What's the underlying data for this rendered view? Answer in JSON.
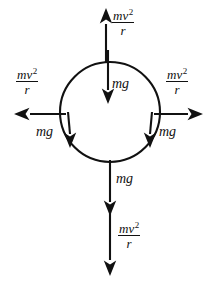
{
  "figure": {
    "stroke_color": "#111111",
    "background_color": "#ffffff",
    "body": {
      "shape": "circle",
      "center_x": 110,
      "center_y": 112,
      "radius": 50
    }
  },
  "labels": {
    "centripetal": {
      "numerator": "mv",
      "exponent": "2",
      "denominator": "r",
      "full_text": "mv^2/r"
    },
    "weight": {
      "text": "mg"
    }
  },
  "vectors": [
    {
      "id": "top-centripetal",
      "name": "mv2r-top",
      "label": "mv^2/r",
      "direction": "up",
      "position": "top"
    },
    {
      "id": "left-centripetal",
      "name": "mv2r-left",
      "label": "mv^2/r",
      "direction": "left",
      "position": "left"
    },
    {
      "id": "right-centripetal",
      "name": "mv2r-right",
      "label": "mv^2/r",
      "direction": "right",
      "position": "right"
    },
    {
      "id": "bottom-centripetal",
      "name": "mv2r-bottom",
      "label": "mv^2/r",
      "direction": "down",
      "position": "bottom"
    },
    {
      "id": "top-weight",
      "name": "mg-top",
      "label": "mg",
      "direction": "down",
      "position": "top-inside"
    },
    {
      "id": "left-weight",
      "name": "mg-left",
      "label": "mg",
      "direction": "down",
      "position": "left-side"
    },
    {
      "id": "right-weight",
      "name": "mg-right",
      "label": "mg",
      "direction": "down",
      "position": "right-side"
    },
    {
      "id": "bottom-weight",
      "name": "mg-bottom",
      "label": "mg",
      "direction": "down",
      "position": "bottom-below"
    }
  ]
}
